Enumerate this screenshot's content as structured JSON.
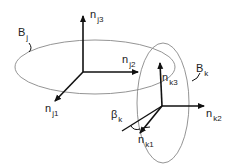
{
  "diagram": {
    "body_j": {
      "label": "B",
      "subscript": "j"
    },
    "body_k": {
      "label": "B",
      "subscript": "k"
    },
    "frame_j": [
      {
        "label": "n",
        "subscript": "j1"
      },
      {
        "label": "n",
        "subscript": "j2"
      },
      {
        "label": "n",
        "subscript": "j3"
      }
    ],
    "frame_k": [
      {
        "label": "n",
        "subscript": "k1"
      },
      {
        "label": "n",
        "subscript": "k2"
      },
      {
        "label": "n",
        "subscript": "k3"
      }
    ],
    "angle": {
      "label": "β",
      "subscript": "k"
    },
    "colors": {
      "stroke": "#111111",
      "ellipse": "#888888"
    }
  }
}
